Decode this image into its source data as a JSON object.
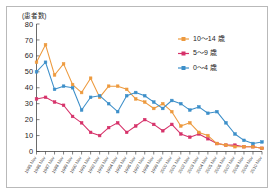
{
  "figure": {
    "y_axis_caption": "(患者数)",
    "border_color": "#b9b9b9",
    "background": "#ffffff"
  },
  "legend": {
    "position": "top-right",
    "items": [
      {
        "label": "10〜14 歳",
        "color": "#ED9A3E",
        "marker": "square"
      },
      {
        "label": "5〜9 歳",
        "color": "#D6326A",
        "marker": "square"
      },
      {
        "label": "0〜4 歳",
        "color": "#3D8FC9",
        "marker": "square"
      }
    ]
  },
  "chart_data": {
    "type": "line",
    "title": "",
    "subtitle": "",
    "xlabel": "",
    "ylabel": "(患者数)",
    "ylim": [
      0,
      80
    ],
    "yticks": [
      0,
      10,
      20,
      30,
      40,
      50,
      60,
      70,
      80
    ],
    "ytick_labels": [
      "0",
      "10",
      "20",
      "30",
      "40",
      "50",
      "60",
      "70",
      "80"
    ],
    "grid": false,
    "legend_position": "top-right",
    "categories": [
      "1985 Nov",
      "1986 Nov",
      "1987 Nov",
      "1988 Nov",
      "1989 Nov",
      "1990 Nov",
      "1991 Nov",
      "1992 Nov",
      "1993 Nov",
      "1994 Nov",
      "1995 Nov",
      "1996 Nov",
      "1997 Nov",
      "1998 Nov",
      "1999 Nov",
      "2000 Nov",
      "2001 Nov",
      "2002 Nov",
      "2003 Nov",
      "2004 Nov",
      "2005 Nov",
      "2006 Nov",
      "2007 Nov",
      "2008 Nov",
      "2009 Nov",
      "2010 Nov"
    ],
    "series": [
      {
        "name": "10〜14 歳",
        "color": "#ED9A3E",
        "values": [
          56,
          67,
          48,
          55,
          42,
          37,
          46,
          34,
          41,
          41,
          39,
          33,
          31,
          27,
          30,
          25,
          16,
          18,
          12,
          10,
          5,
          4,
          3,
          3,
          3,
          2
        ]
      },
      {
        "name": "5〜9 歳",
        "color": "#D6326A",
        "values": [
          33,
          34,
          31,
          29,
          22,
          18,
          12,
          10,
          15,
          18,
          12,
          16,
          20,
          17,
          13,
          17,
          11,
          9,
          11,
          8,
          5,
          4,
          4,
          3,
          3,
          2
        ]
      },
      {
        "name": "0〜4 歳",
        "color": "#3D8FC9",
        "values": [
          50,
          56,
          39,
          41,
          40,
          26,
          34,
          35,
          30,
          25,
          35,
          37,
          35,
          31,
          27,
          32,
          30,
          26,
          28,
          24,
          25,
          18,
          11,
          7,
          5,
          6
        ]
      }
    ]
  }
}
